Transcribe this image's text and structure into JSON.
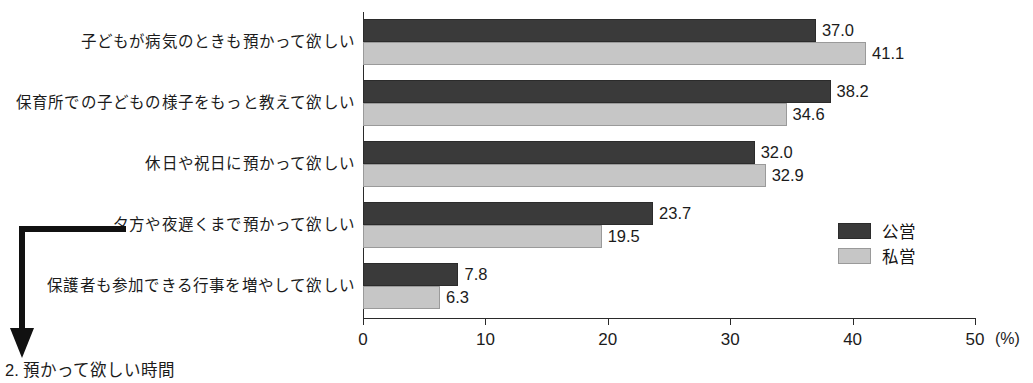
{
  "caption": "2. 預かって欲しい時間",
  "colors": {
    "public_bar": "#3a3a3a",
    "private_bar": "#c6c6c6",
    "axis": "#2a2a2a",
    "text": "#1b1b1b",
    "background": "#ffffff"
  },
  "legend": {
    "items": [
      {
        "label": "公営",
        "series": "public"
      },
      {
        "label": "私営",
        "series": "private"
      }
    ]
  },
  "axis": {
    "unit": "(%)",
    "ticks": [
      "0",
      "10",
      "20",
      "30",
      "40",
      "50"
    ]
  },
  "chart_data": {
    "type": "bar",
    "orientation": "horizontal",
    "title": "",
    "subtitle": "",
    "xlabel": "(%)",
    "ylabel": "",
    "xlim": [
      0,
      50
    ],
    "xticks": [
      0,
      10,
      20,
      30,
      40,
      50
    ],
    "grid": false,
    "legend_position": "right-middle",
    "categories": [
      "子どもが病気のときも預かって欲しい",
      "保育所での子どもの様子をもっと教えて欲しい",
      "休日や祝日に預かって欲しい",
      "夕方や夜遅くまで預かって欲しい",
      "保護者も参加できる行事を増やして欲しい"
    ],
    "series": [
      {
        "name": "公営",
        "values": [
          37.0,
          38.2,
          32.0,
          23.7,
          7.8
        ],
        "labels": [
          "37.0",
          "38.2",
          "32.0",
          "23.7",
          "7.8"
        ]
      },
      {
        "name": "私営",
        "values": [
          41.1,
          34.6,
          32.9,
          19.5,
          6.3
        ],
        "labels": [
          "41.1",
          "34.6",
          "32.9",
          "19.5",
          "6.3"
        ]
      }
    ]
  }
}
